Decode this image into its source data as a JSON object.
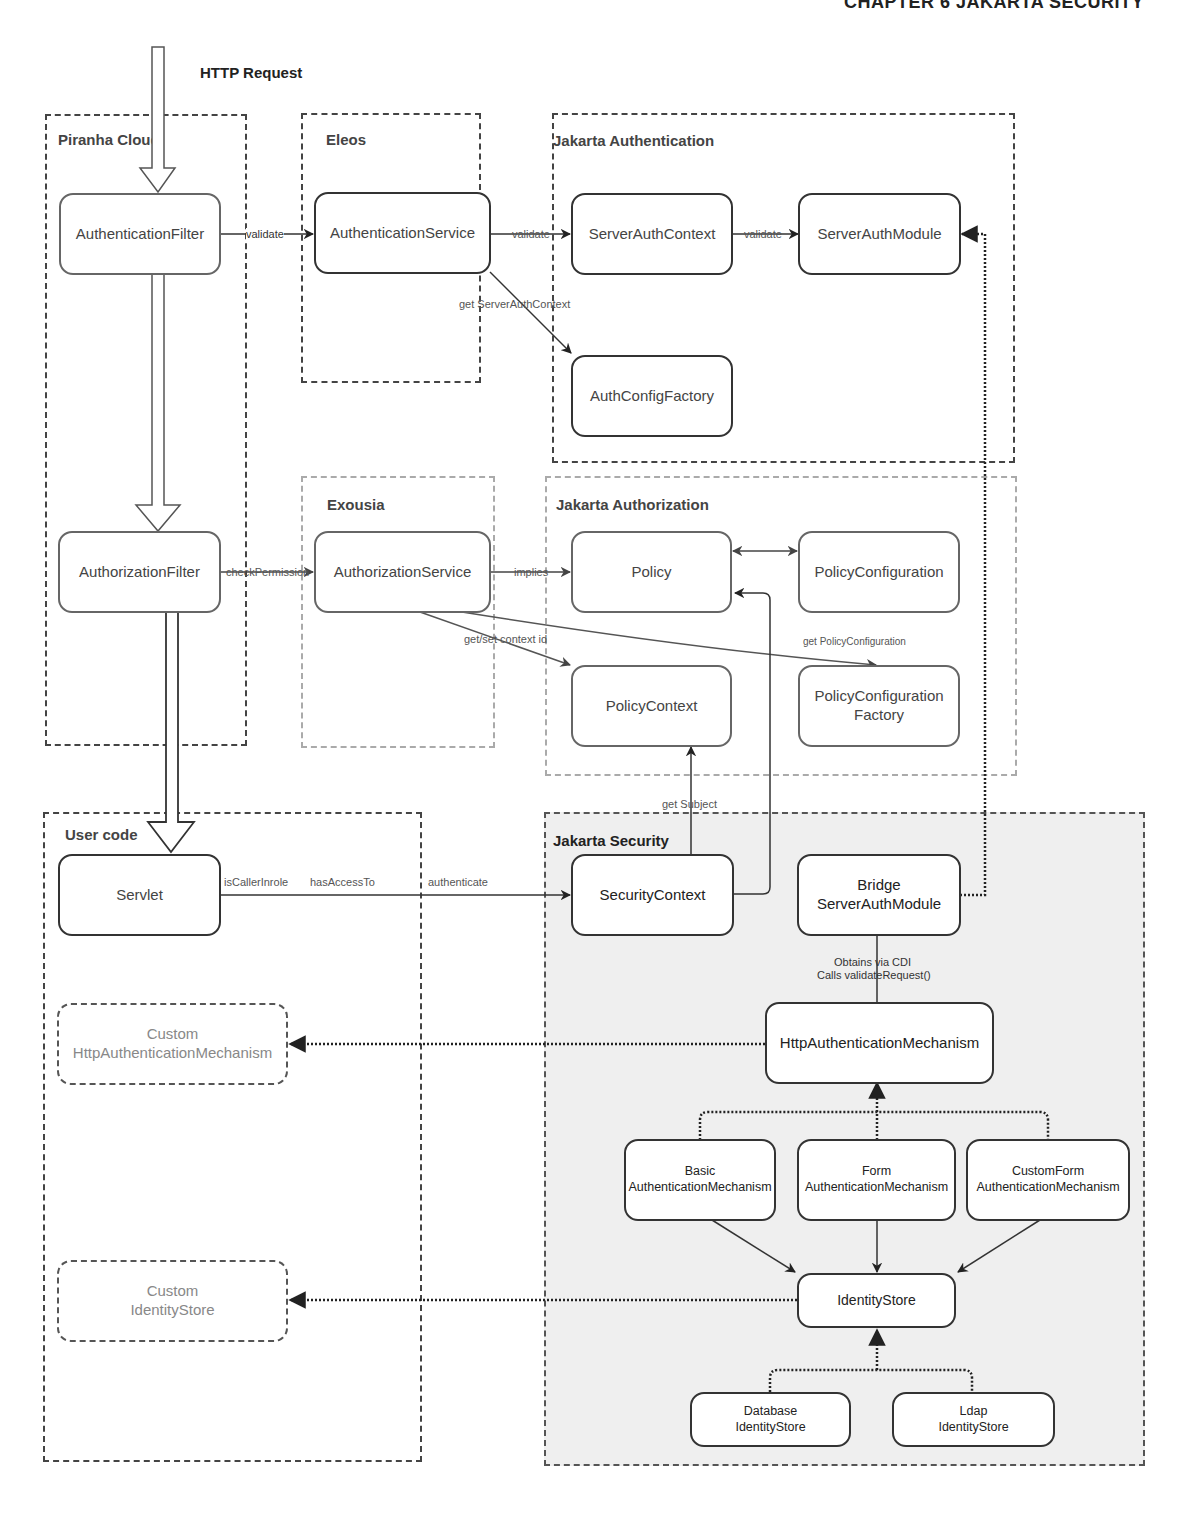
{
  "page": {
    "header": "CHAPTER 6    JAKARTA SECURITY"
  },
  "entry": {
    "label": "HTTP Request"
  },
  "groups": {
    "piranha": {
      "title": "Piranha Cloud"
    },
    "eleos": {
      "title": "Eleos"
    },
    "jakarta_authentication": {
      "title": "Jakarta Authentication"
    },
    "exousia": {
      "title": "Exousia"
    },
    "jakarta_authorization": {
      "title": "Jakarta Authorization"
    },
    "user_code": {
      "title": "User code"
    },
    "jakarta_security": {
      "title": "Jakarta  Security"
    }
  },
  "nodes": {
    "authentication_filter": "AuthenticationFilter",
    "authentication_service": "AuthenticationService",
    "server_auth_context": "ServerAuthContext",
    "server_auth_module": "ServerAuthModule",
    "auth_config_factory": "AuthConfigFactory",
    "authorization_filter": "AuthorizationFilter",
    "authorization_service": "AuthorizationService",
    "policy": "Policy",
    "policy_configuration": "PolicyConfiguration",
    "policy_context": "PolicyContext",
    "policy_configuration_factory": {
      "line1": "PolicyConfiguration",
      "line2": "Factory"
    },
    "servlet": "Servlet",
    "security_context": "SecurityContext",
    "bridge_server_auth_module": {
      "line1": "Bridge",
      "line2": "ServerAuthModule"
    },
    "custom_http_auth_mechanism": {
      "line1": "Custom",
      "line2": "HttpAuthenticationMechanism"
    },
    "http_authentication_mechanism": "HttpAuthenticationMechanism",
    "basic_auth_mechanism": {
      "line1": "Basic",
      "line2": "AuthenticationMechanism"
    },
    "form_auth_mechanism": {
      "line1": "Form",
      "line2": "AuthenticationMechanism"
    },
    "custom_form_auth_mechanism": {
      "line1": "CustomForm",
      "line2": "AuthenticationMechanism"
    },
    "custom_identity_store": {
      "line1": "Custom",
      "line2": "IdentityStore"
    },
    "identity_store": "IdentityStore",
    "database_identity_store": {
      "line1": "Database",
      "line2": "IdentityStore"
    },
    "ldap_identity_store": {
      "line1": "Ldap",
      "line2": "IdentityStore"
    }
  },
  "edges": {
    "validate_1": "validate",
    "validate_2": "validate",
    "validate_3": "validate",
    "get_server_auth_context": "get ServerAuthContext",
    "check_permission": "checkPermission",
    "implies": "implies",
    "get_set_context_id": "get/set context id",
    "get_policy_configuration": "get PolicyConfiguration",
    "get_subject": "get Subject",
    "is_caller_in_role": "isCallerInrole",
    "has_access_to": "hasAccessTo",
    "authenticate": "authenticate",
    "obtains_via_cdi": "Obtains via CDI",
    "calls_validate_request": "Calls validateRequest()"
  }
}
